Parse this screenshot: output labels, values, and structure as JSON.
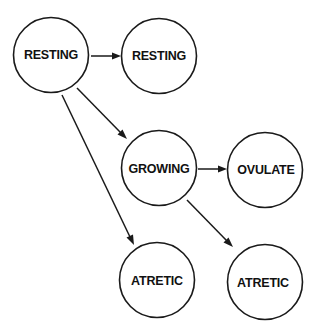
{
  "diagram": {
    "type": "state-flow",
    "nodes": [
      {
        "id": "resting_start",
        "label": "RESTING"
      },
      {
        "id": "resting_end",
        "label": "RESTING"
      },
      {
        "id": "growing",
        "label": "GROWING"
      },
      {
        "id": "ovulate",
        "label": "OVULATE"
      },
      {
        "id": "atretic_from_resting",
        "label": "ATRETIC"
      },
      {
        "id": "atretic_from_growing",
        "label": "ATRETIC"
      }
    ],
    "edges": [
      {
        "from": "resting_start",
        "to": "resting_end"
      },
      {
        "from": "resting_start",
        "to": "growing"
      },
      {
        "from": "resting_start",
        "to": "atretic_from_resting"
      },
      {
        "from": "growing",
        "to": "ovulate"
      },
      {
        "from": "growing",
        "to": "atretic_from_growing"
      }
    ]
  }
}
